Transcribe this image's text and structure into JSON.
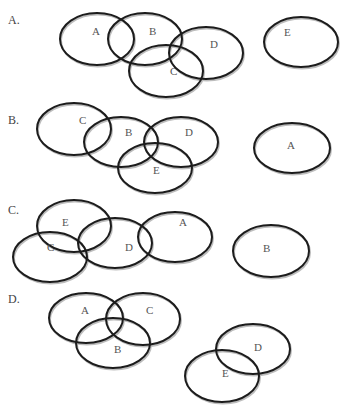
{
  "diagram": {
    "type": "venn-options",
    "options": [
      {
        "label": "A.",
        "label_pos": [
          8,
          24
        ],
        "sets": [
          {
            "name": "A",
            "cx": 97,
            "cy": 39,
            "rx": 37,
            "ry": 26,
            "tx": 92,
            "ty": 35
          },
          {
            "name": "B",
            "cx": 145,
            "cy": 39,
            "rx": 37,
            "ry": 26,
            "tx": 149,
            "ty": 35
          },
          {
            "name": "C",
            "cx": 166,
            "cy": 71,
            "rx": 37,
            "ry": 26,
            "tx": 170,
            "ty": 75
          },
          {
            "name": "D",
            "cx": 206,
            "cy": 53,
            "rx": 37,
            "ry": 26,
            "tx": 210,
            "ty": 48
          },
          {
            "name": "E",
            "cx": 301,
            "cy": 42,
            "rx": 37,
            "ry": 25,
            "tx": 284,
            "ty": 36
          }
        ]
      },
      {
        "label": "B.",
        "label_pos": [
          8,
          124
        ],
        "sets": [
          {
            "name": "C",
            "cx": 74,
            "cy": 129,
            "rx": 37,
            "ry": 26,
            "tx": 79,
            "ty": 124
          },
          {
            "name": "B",
            "cx": 121,
            "cy": 142,
            "rx": 37,
            "ry": 25,
            "tx": 125,
            "ty": 136
          },
          {
            "name": "D",
            "cx": 181,
            "cy": 142,
            "rx": 37,
            "ry": 25,
            "tx": 185,
            "ty": 136
          },
          {
            "name": "E",
            "cx": 155,
            "cy": 168,
            "rx": 37,
            "ry": 25,
            "tx": 153,
            "ty": 174
          },
          {
            "name": "A",
            "cx": 292,
            "cy": 148,
            "rx": 38,
            "ry": 25,
            "tx": 287,
            "ty": 149
          }
        ]
      },
      {
        "label": "C.",
        "label_pos": [
          8,
          214
        ],
        "sets": [
          {
            "name": "E",
            "cx": 74,
            "cy": 226,
            "rx": 37,
            "ry": 26,
            "tx": 62,
            "ty": 226
          },
          {
            "name": "C",
            "cx": 50,
            "cy": 257,
            "rx": 37,
            "ry": 25,
            "tx": 47,
            "ty": 251
          },
          {
            "name": "D",
            "cx": 115,
            "cy": 243,
            "rx": 37,
            "ry": 25,
            "tx": 125,
            "ty": 251
          },
          {
            "name": "A",
            "cx": 175,
            "cy": 237,
            "rx": 37,
            "ry": 25,
            "tx": 179,
            "ty": 226
          },
          {
            "name": "B",
            "cx": 271,
            "cy": 251,
            "rx": 38,
            "ry": 26,
            "tx": 263,
            "ty": 252
          }
        ]
      },
      {
        "label": "D.",
        "label_pos": [
          8,
          303
        ],
        "sets": [
          {
            "name": "A",
            "cx": 86,
            "cy": 318,
            "rx": 37,
            "ry": 25,
            "tx": 81,
            "ty": 314
          },
          {
            "name": "C",
            "cx": 143,
            "cy": 319,
            "rx": 37,
            "ry": 26,
            "tx": 146,
            "ty": 314
          },
          {
            "name": "B",
            "cx": 113,
            "cy": 343,
            "rx": 37,
            "ry": 25,
            "tx": 114,
            "ty": 353
          },
          {
            "name": "D",
            "cx": 253,
            "cy": 349,
            "rx": 37,
            "ry": 25,
            "tx": 254,
            "ty": 351
          },
          {
            "name": "E",
            "cx": 222,
            "cy": 376,
            "rx": 37,
            "ry": 26,
            "tx": 222,
            "ty": 377
          }
        ]
      }
    ]
  },
  "colors": {
    "stroke": "#1c1c1c",
    "shadow": "#bdbdbd",
    "text": "#555555",
    "background": "#ffffff"
  }
}
